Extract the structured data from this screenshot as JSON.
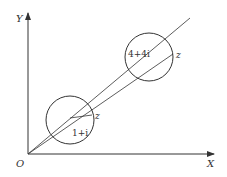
{
  "diagram": {
    "axes": {
      "x_label": "X",
      "y_label": "Y",
      "origin_label": "O"
    },
    "circles": [
      {
        "center_label": "1+i",
        "point_label": "z"
      },
      {
        "center_label": "4+4i",
        "point_label": "z"
      }
    ],
    "colors": {
      "stroke": "#333333",
      "background": "#ffffff"
    }
  }
}
